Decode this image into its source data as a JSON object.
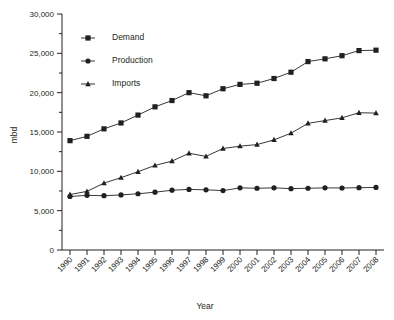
{
  "chart_data": {
    "type": "line",
    "title": "",
    "xlabel": "Year",
    "ylabel": "mbd",
    "ylim": [
      0,
      30000
    ],
    "ytick_step": 5000,
    "yminor_step": 2500,
    "grid": false,
    "legend_position": "top-left",
    "xtick_rotation": -45,
    "categories": [
      "1990",
      "1991",
      "1992",
      "1993",
      "1994",
      "1995",
      "1996",
      "1997",
      "1998",
      "1999",
      "2000",
      "2001",
      "2002",
      "2003",
      "2004",
      "2005",
      "2006",
      "2007",
      "2008"
    ],
    "ytick_labels": [
      "0",
      "5,000",
      "10,000",
      "15,000",
      "20,000",
      "25,000",
      "30,000"
    ],
    "ytick_values": [
      0,
      5000,
      10000,
      15000,
      20000,
      25000,
      30000
    ],
    "series": [
      {
        "name": "Demand",
        "marker": "square",
        "color": "#231f20",
        "values": [
          13900,
          14450,
          15400,
          16150,
          17150,
          18200,
          19000,
          20000,
          19600,
          20500,
          21050,
          21200,
          21800,
          22600,
          23950,
          24300,
          24700,
          25350,
          25400
        ]
      },
      {
        "name": "Production",
        "marker": "circle",
        "color": "#231f20",
        "values": [
          6800,
          6950,
          6900,
          7000,
          7150,
          7350,
          7600,
          7700,
          7650,
          7550,
          7900,
          7850,
          7900,
          7800,
          7850,
          7900,
          7880,
          7920,
          7950
        ]
      },
      {
        "name": "Imports",
        "marker": "triangle",
        "color": "#231f20",
        "values": [
          7050,
          7450,
          8500,
          9200,
          9950,
          10750,
          11300,
          12300,
          11900,
          12900,
          13200,
          13400,
          14000,
          14850,
          16100,
          16450,
          16800,
          17450,
          17400
        ]
      }
    ]
  },
  "legend": {
    "items": [
      {
        "label": "Demand"
      },
      {
        "label": "Production"
      },
      {
        "label": "Imports"
      }
    ]
  },
  "axes": {
    "x_title": "Year",
    "y_title": "mbd"
  }
}
